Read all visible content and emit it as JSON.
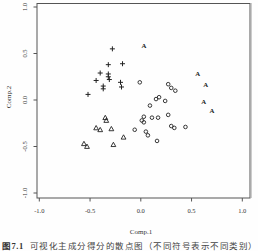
{
  "figure": {
    "caption_label": "图7.1",
    "caption_text": "可视化主成分得分的散点图（不同符号表示不同类别）"
  },
  "chart_data": {
    "type": "scatter",
    "title": "",
    "xlabel": "Comp.1",
    "ylabel": "Comp.2",
    "xlim": [
      -1.0,
      1.0
    ],
    "ylim": [
      -1.0,
      1.0
    ],
    "x_ticks": [
      "-1.0",
      "-0.5",
      "0.0",
      "0.5",
      "1.0"
    ],
    "y_ticks": [
      "-1.0",
      "-0.5",
      "0.0",
      "0.5",
      "1.0"
    ],
    "grid": false,
    "legend": "none",
    "point_color": "#222222",
    "box_color": "#555555",
    "series": [
      {
        "name": "group-plus",
        "symbol": "plus",
        "points": [
          [
            -0.28,
            0.55
          ],
          [
            -0.18,
            0.39
          ],
          [
            -0.32,
            0.38
          ],
          [
            -0.4,
            0.29
          ],
          [
            -0.32,
            0.28
          ],
          [
            -0.32,
            0.25
          ],
          [
            -0.44,
            0.21
          ],
          [
            -0.31,
            0.22
          ],
          [
            -0.2,
            0.19
          ],
          [
            -0.37,
            0.15
          ],
          [
            -0.37,
            0.12
          ],
          [
            -0.19,
            0.14
          ],
          [
            -0.52,
            0.06
          ]
        ]
      },
      {
        "name": "group-letter-A",
        "symbol": "letter-A",
        "points": [
          [
            0.03,
            0.58
          ],
          [
            0.56,
            0.28
          ],
          [
            0.64,
            0.17
          ],
          [
            0.62,
            -0.02
          ],
          [
            0.7,
            -0.11
          ]
        ]
      },
      {
        "name": "group-circle",
        "symbol": "circle",
        "points": [
          [
            -0.01,
            0.19
          ],
          [
            0.27,
            0.17
          ],
          [
            0.3,
            0.13
          ],
          [
            0.34,
            0.1
          ],
          [
            0.18,
            0.03
          ],
          [
            0.15,
            0.01
          ],
          [
            0.24,
            -0.01
          ],
          [
            0.09,
            -0.06
          ],
          [
            0.27,
            -0.16
          ],
          [
            0.03,
            -0.18
          ],
          [
            0.11,
            -0.19
          ],
          [
            0.17,
            -0.19
          ],
          [
            0.01,
            -0.22
          ],
          [
            0.03,
            -0.24
          ],
          [
            0.3,
            -0.28
          ],
          [
            0.33,
            -0.3
          ],
          [
            0.44,
            -0.29
          ],
          [
            -0.06,
            -0.32
          ],
          [
            0.05,
            -0.34
          ],
          [
            0.07,
            -0.38
          ],
          [
            0.16,
            -0.44
          ]
        ]
      },
      {
        "name": "group-triangle",
        "symbol": "triangle",
        "points": [
          [
            -0.35,
            -0.19
          ],
          [
            -0.34,
            -0.22
          ],
          [
            -0.44,
            -0.3
          ],
          [
            -0.4,
            -0.32
          ],
          [
            -0.29,
            -0.31
          ],
          [
            -0.17,
            -0.4
          ],
          [
            -0.27,
            -0.48
          ],
          [
            -0.56,
            -0.47
          ],
          [
            -0.53,
            -0.5
          ]
        ]
      }
    ]
  }
}
